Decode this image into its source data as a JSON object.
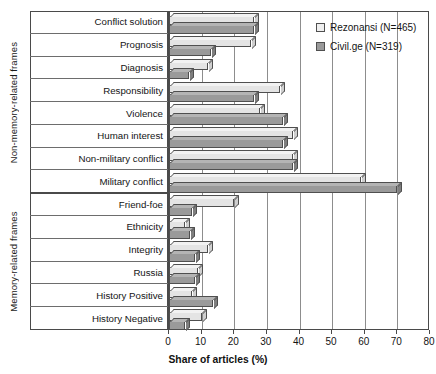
{
  "chart_data": {
    "type": "bar",
    "orientation": "horizontal",
    "title": "",
    "xlabel": "Share of articles (%)",
    "ylabel": "",
    "xlim": [
      0,
      80
    ],
    "xticks": [
      0,
      10,
      20,
      30,
      40,
      50,
      60,
      70,
      80
    ],
    "grid": "vertical",
    "legend_position": "top-right",
    "categories": [
      "Conflict solution",
      "Prognosis",
      "Diagnosis",
      "Responsibility",
      "Violence",
      "Human interest",
      "Non-military conflict",
      "Military conflict",
      "Friend-foe",
      "Ethnicity",
      "Integrity",
      "Russia",
      "History Positive",
      "History Negative"
    ],
    "series": [
      {
        "name": "Rezonansi (N=465)",
        "color": "#e4e4e4",
        "values": [
          26,
          25,
          12,
          34,
          28,
          38,
          38,
          59,
          20,
          5,
          12,
          9,
          7,
          10
        ]
      },
      {
        "name": "Civil.ge (N=319)",
        "color": "#9a9a9a",
        "values": [
          26,
          13,
          6,
          26,
          35,
          35,
          38,
          70,
          7,
          6.5,
          8,
          8,
          13.5,
          5
        ]
      }
    ],
    "groups": [
      {
        "label": "Non-memory-related frames",
        "first": 0,
        "last": 7
      },
      {
        "label": "Memory-related frames",
        "first": 8,
        "last": 13
      }
    ]
  },
  "legend": {
    "items": [
      {
        "label": "Rezonansi (N=465)",
        "swatch": "light"
      },
      {
        "label": "Civil.ge (N=319)",
        "swatch": "dark"
      }
    ]
  },
  "axis": {
    "x_title": "Share of articles (%)",
    "tick_labels": [
      "0",
      "10",
      "20",
      "30",
      "40",
      "50",
      "60",
      "70",
      "80"
    ]
  }
}
